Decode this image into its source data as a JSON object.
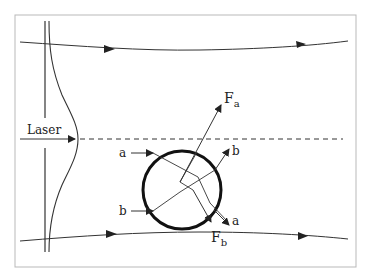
{
  "diagram": {
    "frame_color": "#b9b9b9",
    "line_color": "#222222",
    "labels": {
      "laser": "Laser",
      "ray_a_in": "a",
      "ray_b_in": "b",
      "ray_b_out": "b",
      "ray_a_out": "a",
      "force_a": "F",
      "force_a_sub": "a",
      "force_b": "F",
      "force_b_sub": "b"
    },
    "elements": [
      {
        "id": "beam-profile",
        "type": "gaussian-intensity-curve"
      },
      {
        "id": "beam-axis",
        "type": "dashed-line"
      },
      {
        "id": "upper-beam-edge",
        "type": "curved-arrow-line"
      },
      {
        "id": "lower-beam-edge",
        "type": "curved-arrow-line"
      },
      {
        "id": "sphere",
        "type": "circle"
      },
      {
        "id": "ray-a",
        "type": "refracted-ray"
      },
      {
        "id": "ray-b",
        "type": "refracted-ray"
      },
      {
        "id": "force-a",
        "type": "force-vector"
      },
      {
        "id": "force-b",
        "type": "force-vector"
      }
    ]
  }
}
